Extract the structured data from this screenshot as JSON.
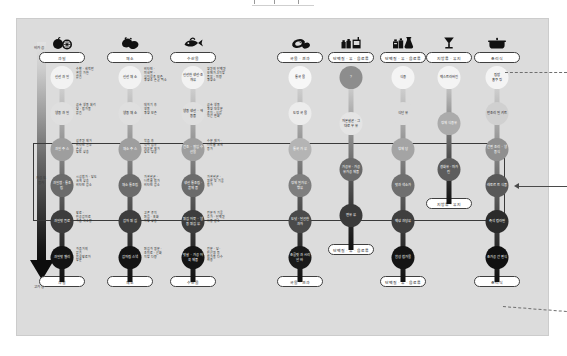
{
  "canvas": {
    "background_color": "#ffffff",
    "card_color": "#dcdcdc",
    "card_border_color": "#cccccc"
  },
  "axis": {
    "label_top": "비가공",
    "label_middle": "가공도\n증가",
    "label_bottom": "고가공",
    "gradient_from": "#e2e2e2",
    "gradient_to": "#0d0d0d"
  },
  "highlight": {
    "border_color": "#3a3a3a",
    "note": "중간 가공 단계 강조 영역"
  },
  "columns": [
    {
      "id": "fruit",
      "icon": "fruit-icon",
      "top_label": "과일",
      "bottom_label": "과일",
      "nodes": [
        {
          "label": "신선 과일",
          "note": "수확 · 세척만\n열을 가한\n없음",
          "color": "#f2f2f2",
          "text": "#1b1b1b"
        },
        {
          "label": "냉동 과일",
          "note": "급속 냉동 처리\n당 · 첨가물\n없음",
          "color": "#dfdfdf",
          "text": "#1b1b1b"
        },
        {
          "label": "과일 주스",
          "note": "섬유질 제거\n비타민 일부\n손실\n당도 상승",
          "color": "#9e9e9e",
          "text": "#ffffff"
        },
        {
          "label": "과일잼 · 통조림",
          "note": "시럽첨가 · 당도\n크게 상승\n비타민 감소",
          "color": "#6b6b6b",
          "text": "#ffffff"
        },
        {
          "label": "과일맛 음료",
          "note": "향료 ·\n인공감미료\n과즙 극소량",
          "color": "#3d3d3d",
          "text": "#ffffff"
        },
        {
          "label": "과일맛 젤리",
          "note": "과즙거의\n없음\n합성향료와\n당분",
          "color": "#141414",
          "text": "#ffffff"
        }
      ]
    },
    {
      "id": "vegetable",
      "icon": "vegetable-icon",
      "top_label": "채소",
      "bottom_label": "채소",
      "nodes": [
        {
          "label": "신선 채소",
          "note": "비타민 ·\n미네랄 ·\n식이섬유 보존\n영양소 손실 최소",
          "color": "#f2f2f2",
          "text": "#1b1b1b"
        },
        {
          "label": "냉동 채소",
          "note": "데치기 후\n냉동\n영양 보존",
          "color": "#dfdfdf",
          "text": "#1b1b1b"
        },
        {
          "label": "채소 주스",
          "note": "착즙 후\n식이 섬유\n대부분 제거\n당도 상승",
          "color": "#9e9e9e",
          "text": "#ffffff"
        },
        {
          "label": "채소 통조림",
          "note": "가열살균 ·\n나트륨 첨가\n비타민 감소",
          "color": "#6b6b6b",
          "text": "#ffffff"
        },
        {
          "label": "감자 튀김",
          "note": "고온 유지\n튀김 · 포화\n지방 상승",
          "color": "#3d3d3d",
          "text": "#ffffff"
        },
        {
          "label": "감자칩 스낵",
          "note": "튀김과 염분 ·\n조미료 · 산화\n지방 다량",
          "color": "#141414",
          "text": "#ffffff"
        }
      ]
    },
    {
      "id": "fish",
      "icon": "fish-icon",
      "top_label": "수산물",
      "bottom_label": "수산물",
      "nodes": [
        {
          "label": "신선한 생선·조개류",
          "note": "양질의 단백질\n오메가-3 지방\n풍부 · 미량\n영양소",
          "color": "#f2f2f2",
          "text": "#1b1b1b"
        },
        {
          "label": "냉동 생선 · 해동품",
          "note": "급속 냉동\n영양 대부분\n유지 · 식감\n약간 변화",
          "color": "#dfdfdf",
          "text": "#1b1b1b"
        },
        {
          "label": "건조 · 절임 수산물",
          "note": "수분 제거 ·\n나트륨 크게\n증가",
          "color": "#9e9e9e",
          "text": "#ffffff"
        },
        {
          "label": "생선 통조림 · 훈제품",
          "note": "가열살균 ·\n염분 및 기름\n첨가",
          "color": "#6b6b6b",
          "text": "#ffffff"
        },
        {
          "label": "튀김 어묵 · 냉동 튀김류",
          "note": "전분과 기름\n추가 · 단백질\n비중 감소",
          "color": "#3d3d3d",
          "text": "#ffffff"
        },
        {
          "label": "맛살 · 가공 어육 제품",
          "note": "전분 · 당 ·\n인산염 등\n첨가물 다수\n사용",
          "color": "#141414",
          "text": "#ffffff"
        }
      ]
    },
    {
      "id": "grain",
      "icon": "grain-icon",
      "top_label": "곡물 · 견과",
      "bottom_label": "곡물 · 견과",
      "nodes": [
        {
          "label": "통곡물",
          "note": "",
          "color": "#f7f7f7",
          "text": "#1b1b1b"
        },
        {
          "label": "도정 곡물",
          "note": "",
          "color": "#ececec",
          "text": "#1b1b1b"
        },
        {
          "label": "통곡 가루",
          "note": "",
          "color": "#b4b4b4",
          "text": "#ffffff"
        },
        {
          "label": "정제 밀가루 · 빵류",
          "note": "",
          "color": "#7e7e7e",
          "text": "#ffffff"
        },
        {
          "label": "도넛 · 달콤한 과자",
          "note": "",
          "color": "#4a4a4a",
          "text": "#ffffff"
        },
        {
          "label": "초콜릿과 시리얼 바",
          "note": "",
          "color": "#1a1a1a",
          "text": "#ffffff"
        }
      ]
    },
    {
      "id": "dairy",
      "icon": "dairy-icon",
      "top_label": "단백질 · 유 · 음료류",
      "bottom_label": "단백질 · 유 · 음료류",
      "nodes": [
        {
          "label": "?",
          "note": "",
          "color": "#8d8d8d",
          "text": "#ffffff"
        },
        {
          "label": "저온살균 · 그대로 우유",
          "note": "",
          "color": "#e4e4e4",
          "text": "#1b1b1b"
        },
        {
          "label": "가공유 · 가공\n유가공 제품",
          "note": "",
          "color": "#6a6a6a",
          "text": "#ffffff"
        },
        {
          "label": "연유류",
          "note": "",
          "color": "#3a3a3a",
          "text": "#ffffff"
        }
      ]
    },
    {
      "id": "supplement",
      "icon": "supplement-icon",
      "top_label": "단백질 · 유 · 음료류",
      "bottom_label": "단백질 · 유 · 음료류",
      "nodes": [
        {
          "label": "식용",
          "note": "",
          "color": "#f4f4f4",
          "text": "#1b1b1b"
        },
        {
          "label": "식단유",
          "note": "",
          "color": "#dcdcdc",
          "text": "#1b1b1b"
        },
        {
          "label": "정제당",
          "note": "",
          "color": "#a4a4a4",
          "text": "#ffffff"
        },
        {
          "label": "맛과 색소가",
          "note": "",
          "color": "#6f6f6f",
          "text": "#ffffff"
        },
        {
          "label": "액상 과당류",
          "note": "",
          "color": "#3f3f3f",
          "text": "#ffffff"
        },
        {
          "label": "합성 첨가물",
          "note": "",
          "color": "#141414",
          "text": "#ffffff"
        }
      ]
    },
    {
      "id": "beverage",
      "icon": "beverage-icon",
      "top_label": "지방류 · 유지",
      "bottom_label": "지방류 · 유지",
      "nodes": [
        {
          "label": "엑스트라버진",
          "note": "",
          "color": "#f4f4f4",
          "text": "#1b1b1b"
        },
        {
          "label": "정제 식용유",
          "note": "",
          "color": "#ababab",
          "text": "#ffffff"
        },
        {
          "label": "경화유 · 마가린",
          "note": "",
          "color": "#5d5d5d",
          "text": "#ffffff"
        }
      ]
    },
    {
      "id": "cooked",
      "icon": "cooked-icon",
      "top_label": "조리식",
      "bottom_label": "조리식",
      "nodes": [
        {
          "label": "집밥\n홈쿠킹",
          "note": "",
          "color": "#f4f4f4",
          "text": "#1b1b1b"
        },
        {
          "label": "반조리 밀키트",
          "note": "",
          "color": "#d0d0d0",
          "text": "#1b1b1b"
        },
        {
          "label": "간편 조리 · 냉동식",
          "note": "",
          "color": "#8f8f8f",
          "text": "#ffffff"
        },
        {
          "label": "레토르트 식품",
          "note": "",
          "color": "#585858",
          "text": "#ffffff"
        },
        {
          "label": "즉석 컵라면",
          "note": "",
          "color": "#2b2b2b",
          "text": "#ffffff"
        },
        {
          "label": "초가공 간편식",
          "note": "",
          "color": "#111111",
          "text": "#ffffff"
        }
      ]
    }
  ],
  "callouts": [
    {
      "id": "callout-top",
      "style": "dashed",
      "label": ""
    },
    {
      "id": "callout-middle",
      "style": "arrow",
      "label": ""
    },
    {
      "id": "callout-bottom",
      "style": "dashed",
      "label": ""
    }
  ]
}
